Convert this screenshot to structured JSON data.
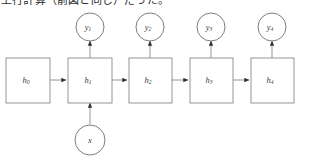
{
  "figure": {
    "caption": "上行計算（前図と同じ）だった。",
    "background_color": "#ffffff",
    "stroke_color": "#8a8a8a",
    "text_color": "#3a3a3a"
  },
  "hidden_states": {
    "label_base": "h",
    "nodes": [
      {
        "id": "h0",
        "base": "h",
        "subscript": "0",
        "x": 28,
        "y": 80
      },
      {
        "id": "h1",
        "base": "h",
        "subscript": "1",
        "x": 90,
        "y": 80
      },
      {
        "id": "h2",
        "base": "h",
        "subscript": "2",
        "x": 150,
        "y": 80
      },
      {
        "id": "h3",
        "base": "h",
        "subscript": "3",
        "x": 211,
        "y": 80
      },
      {
        "id": "h4",
        "base": "h",
        "subscript": "4",
        "x": 272,
        "y": 80
      }
    ]
  },
  "outputs": {
    "label_base": "y",
    "nodes": [
      {
        "id": "y1",
        "base": "y",
        "subscript": "1",
        "x": 90,
        "y": 27
      },
      {
        "id": "y2",
        "base": "y",
        "subscript": "2",
        "x": 150,
        "y": 27
      },
      {
        "id": "y3",
        "base": "y",
        "subscript": "3",
        "x": 211,
        "y": 27
      },
      {
        "id": "y4",
        "base": "y",
        "subscript": "4",
        "x": 272,
        "y": 27
      }
    ]
  },
  "input": {
    "id": "x",
    "base": "x",
    "subscript": "",
    "x": 90,
    "y": 140
  },
  "edges": {
    "horizontal": [
      {
        "from": "h0",
        "to": "h1"
      },
      {
        "from": "h1",
        "to": "h2"
      },
      {
        "from": "h2",
        "to": "h3"
      },
      {
        "from": "h3",
        "to": "h4"
      }
    ],
    "vertical_up": [
      {
        "from": "h1",
        "to": "y1"
      },
      {
        "from": "h2",
        "to": "y2"
      },
      {
        "from": "h3",
        "to": "y3"
      },
      {
        "from": "h4",
        "to": "y4"
      }
    ],
    "input_edge": {
      "from": "x",
      "to": "h1"
    }
  }
}
